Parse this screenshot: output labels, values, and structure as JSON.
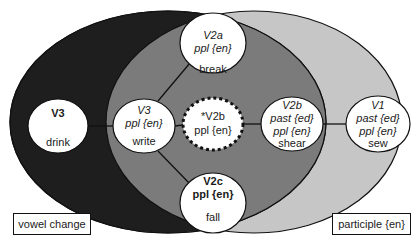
{
  "colors": {
    "vowel_change_set": "#1e1e1e",
    "participle_set": "#c6c6c6",
    "intersection": "#7b7b7b",
    "node_fill": "#ffffff",
    "stroke": "#111111"
  },
  "sets": {
    "left": {
      "label": "vowel change"
    },
    "right": {
      "label": "participle {en}"
    }
  },
  "nodes": {
    "v3_drink": {
      "line1": "V3",
      "line2": "",
      "word": "drink"
    },
    "v3_write": {
      "line1": "V3",
      "line2": "ppl {en}",
      "word": "write"
    },
    "v2a_break": {
      "line1": "V2a",
      "line2": "ppl {en}",
      "word": "break"
    },
    "v2b_star": {
      "line1": "*V2b",
      "line2": "ppl {en}"
    },
    "v2b_shear": {
      "line1": "V2b",
      "line2": "past {ed}",
      "line3": "ppl {en}",
      "word": "shear"
    },
    "v2c_fall": {
      "line1": "V2c",
      "line2": "ppl {en}",
      "word": "fall"
    },
    "v1_sew": {
      "line1": "V1",
      "line2": "past {ed}",
      "line3": "ppl {en}",
      "word": "sew"
    }
  }
}
